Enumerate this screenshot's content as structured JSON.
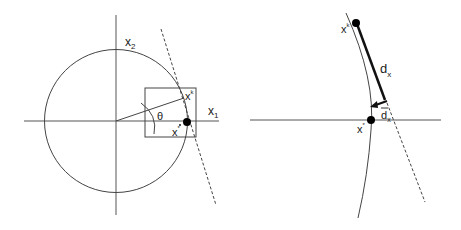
{
  "left_panel": {
    "axis_x_label": "x",
    "axis_x_sub": "1",
    "axis_y_label": "x",
    "axis_y_sub": "2",
    "angle_label": "θ",
    "iterate_label": "x",
    "iterate_sup": "k",
    "optimum_label": "x",
    "optimum_sup": "*"
  },
  "right_panel": {
    "iterate_label": "x",
    "iterate_sup": "k",
    "optimum_label": "x",
    "optimum_sup": "*",
    "direction_label": "d",
    "direction_sub": "x",
    "projected_label": "d",
    "projected_sub": "x"
  },
  "colors": {
    "line": "#444444",
    "thick": "#111111",
    "dot": "#000000"
  }
}
